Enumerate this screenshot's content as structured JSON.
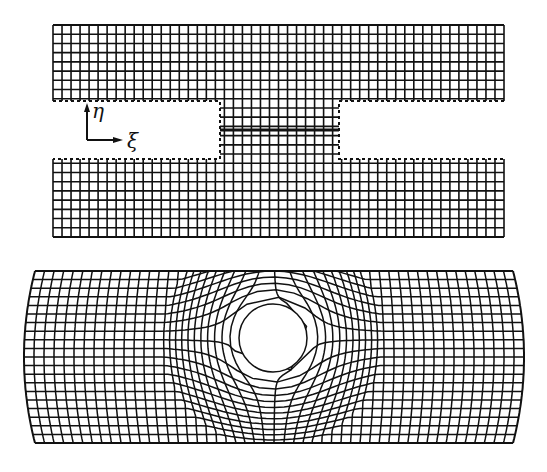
{
  "figure": {
    "width": 547,
    "height": 472,
    "line_color": "#111111",
    "background": "#ffffff"
  },
  "top_mesh": {
    "description": "Rectangular computational grid with two rectangular notches (left and right) forming a slit region; thick line marks the slit/branch cut",
    "x0": 53,
    "x1": 504,
    "y0": 25,
    "y1": 237,
    "cols": 50,
    "rows": 23,
    "notch_top": 101,
    "notch_bottom": 159,
    "left_notch_x1": 220,
    "right_notch_x0": 339,
    "cut_line": {
      "x0": 220,
      "x1": 339,
      "y": 130,
      "width": 3
    }
  },
  "axes": {
    "origin": [
      87,
      140
    ],
    "eta": {
      "label": "η",
      "tip": [
        87,
        103
      ],
      "label_pos": [
        92,
        118
      ]
    },
    "xi": {
      "label": "ξ",
      "tip": [
        123,
        140
      ],
      "label_pos": [
        127,
        148
      ]
    }
  },
  "bottom_mesh": {
    "description": "Physical-domain body-fitted grid around a circular hole, with bulging left/right boundaries",
    "x_left_top": 35,
    "x_left_mid": 24,
    "x_right_top": 513,
    "x_right_mid": 524,
    "y0": 271,
    "y1": 443,
    "cols": 50,
    "rows": 20,
    "hole": {
      "cx": 273,
      "cy": 338,
      "r": 34
    }
  }
}
